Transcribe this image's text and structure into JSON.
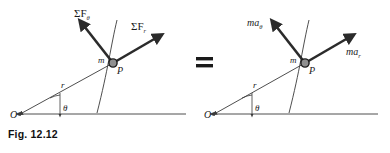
{
  "figure": {
    "caption": "Fig. 12.12",
    "equals_sign": "=",
    "panels": [
      {
        "id": "forces",
        "origin_label": "O",
        "angle_label": "θ",
        "radius_label": "r",
        "mass_label": "m",
        "point_label": "P",
        "vectors": [
          {
            "name": "transverse-force",
            "symbol": "ΣF",
            "subscript": "θ"
          },
          {
            "name": "radial-force",
            "symbol": "ΣF",
            "subscript": "r"
          }
        ]
      },
      {
        "id": "mass-acceleration",
        "origin_label": "O",
        "angle_label": "θ",
        "radius_label": "r",
        "mass_label": "m",
        "point_label": "P",
        "vectors": [
          {
            "name": "transverse-ma",
            "symbol": "ma",
            "subscript": "θ"
          },
          {
            "name": "radial-ma",
            "symbol": "ma",
            "subscript": "r"
          }
        ]
      }
    ]
  },
  "colors": {
    "ink": "#1a1a1a",
    "vector": "#2b2b2b",
    "thin_line": "#3a3a3a",
    "mass_dot_fill": "#8f8f8f",
    "mass_dot_stroke": "#1a1a1a",
    "background": "#ffffff"
  }
}
